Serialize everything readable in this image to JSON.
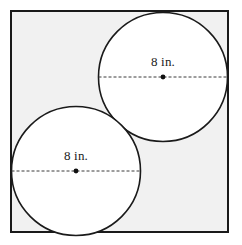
{
  "figure": {
    "canvas": {
      "width": 242,
      "height": 245
    },
    "background_color": "#ffffff",
    "square": {
      "name": "bounding-square",
      "x": 11,
      "y": 11,
      "width": 217,
      "height": 221,
      "fill_color": "#f1f1f1",
      "stroke_color": "#1a1a1a",
      "stroke_width": 2
    },
    "circles": [
      {
        "name": "top-right-circle",
        "cx": 163,
        "cy": 77,
        "r": 64.5,
        "fill_color": "#ffffff",
        "stroke_color": "#1a1a1a",
        "stroke_width": 1.6,
        "label": "8 in.",
        "label_x": 163,
        "label_y": 61,
        "diameter_line": {
          "x1": 98.5,
          "y1": 77,
          "x2": 227.5,
          "y2": 77,
          "style": "dashed",
          "stroke_color": "#3a3a3a",
          "dash": "3 2"
        },
        "center_dot": {
          "cx": 163,
          "cy": 77,
          "r": 2.4,
          "color": "#111111"
        }
      },
      {
        "name": "bottom-left-circle",
        "cx": 76,
        "cy": 171,
        "r": 64.5,
        "fill_color": "#ffffff",
        "stroke_color": "#1a1a1a",
        "stroke_width": 1.6,
        "label": "8 in.",
        "label_x": 76,
        "label_y": 155,
        "diameter_line": {
          "x1": 11.5,
          "y1": 171,
          "x2": 140.5,
          "y2": 171,
          "style": "dashed",
          "stroke_color": "#3a3a3a",
          "dash": "3 2"
        },
        "center_dot": {
          "cx": 76,
          "cy": 171,
          "r": 2.4,
          "color": "#111111"
        }
      }
    ],
    "labels": {
      "top_circle_diameter": "8 in.",
      "bottom_circle_diameter": "8 in."
    }
  }
}
